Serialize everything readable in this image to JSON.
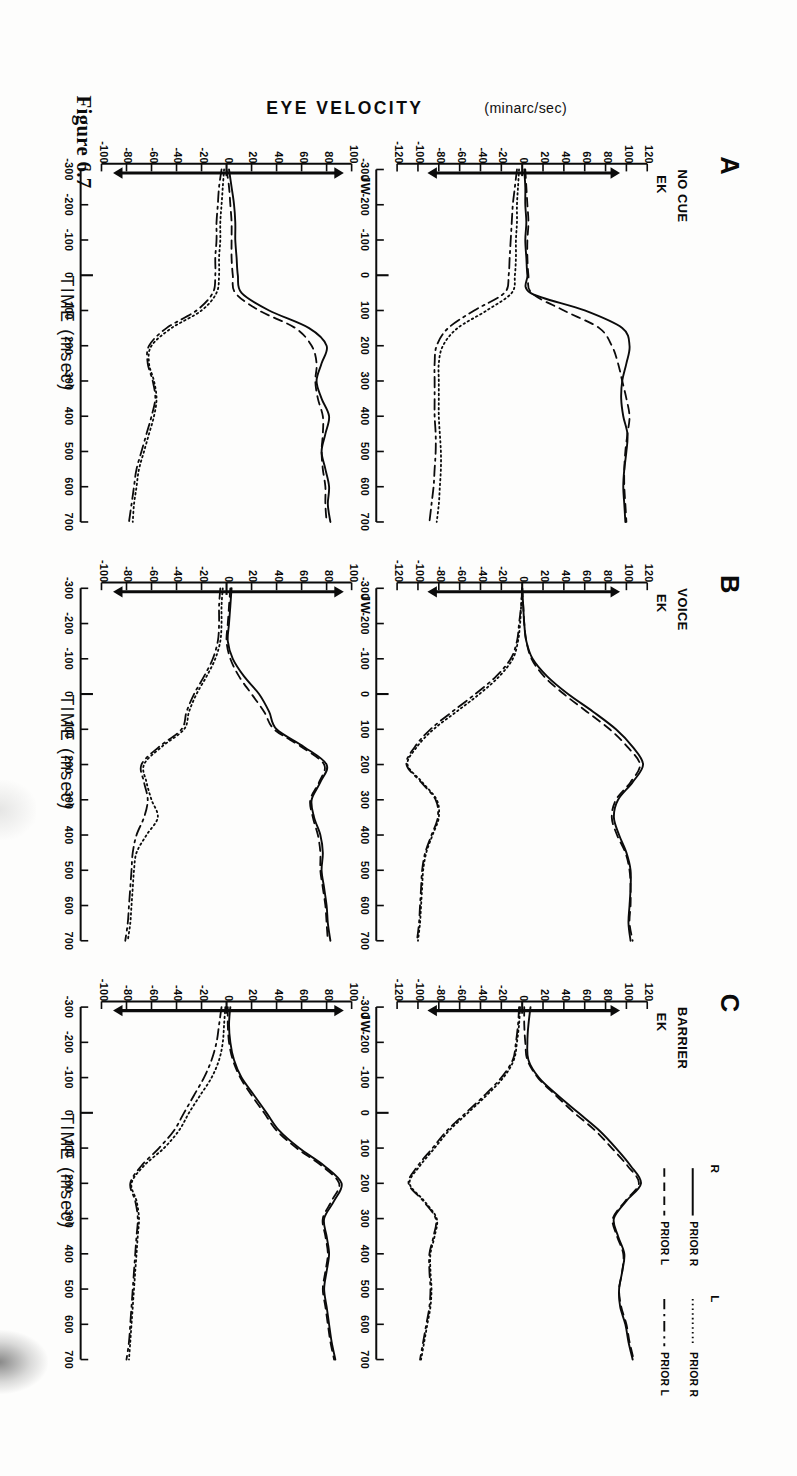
{
  "figure": {
    "caption": "Figure 6.7",
    "y_axis_label": "EYE VELOCITY",
    "y_axis_unit": "(minarc/sec)",
    "x_axis_label": "TIME (msec)"
  },
  "panels": [
    {
      "letter": "A",
      "condition": "NO CUE",
      "subjects": [
        {
          "name": "EK",
          "ylim": [
            -120,
            120
          ],
          "yticks": [
            120,
            100,
            80,
            60,
            40,
            20,
            0,
            -20,
            -40,
            -60,
            -80,
            -100,
            -120
          ]
        },
        {
          "name": "JW",
          "ylim": [
            -100,
            100
          ],
          "yticks": [
            100,
            80,
            60,
            40,
            20,
            0,
            -20,
            -40,
            -60,
            -80,
            -100
          ]
        }
      ]
    },
    {
      "letter": "B",
      "condition": "VOICE",
      "subjects": [
        {
          "name": "EK",
          "ylim": [
            -120,
            120
          ],
          "yticks": [
            120,
            100,
            80,
            60,
            40,
            20,
            0,
            -20,
            -40,
            -60,
            -80,
            -100,
            -120
          ]
        },
        {
          "name": "JW",
          "ylim": [
            -100,
            100
          ],
          "yticks": [
            100,
            80,
            60,
            40,
            20,
            0,
            -20,
            -40,
            -60,
            -80,
            -100
          ]
        }
      ]
    },
    {
      "letter": "C",
      "condition": "BARRIER",
      "subjects": [
        {
          "name": "EK",
          "ylim": [
            -120,
            120
          ],
          "yticks": [
            120,
            100,
            80,
            60,
            40,
            20,
            0,
            -20,
            -40,
            -60,
            -80,
            -100,
            -120
          ]
        },
        {
          "name": "JW",
          "ylim": [
            -100,
            100
          ],
          "yticks": [
            100,
            80,
            60,
            40,
            20,
            0,
            -20,
            -40,
            -60,
            -80,
            -100
          ]
        }
      ]
    }
  ],
  "xticks": [
    -300,
    -200,
    -100,
    0,
    100,
    200,
    300,
    400,
    500,
    600,
    700
  ],
  "legend": {
    "groups": [
      {
        "head": "R",
        "entries": [
          {
            "label": "PRIOR R",
            "style": "solid"
          },
          {
            "label": "PRIOR L",
            "style": "dashed"
          }
        ]
      },
      {
        "head": "L",
        "entries": [
          {
            "label": "PRIOR R",
            "style": "dotted"
          },
          {
            "label": "PRIOR L",
            "style": "dashdot"
          }
        ]
      }
    ]
  },
  "chart_data": {
    "type": "line",
    "title": "Figure 6.7",
    "xlabel": "TIME (msec)",
    "ylabel": "EYE VELOCITY (minarc/sec)",
    "xlim": [
      -300,
      700
    ],
    "grid": false,
    "legend_position": "top-right",
    "x": [
      -300,
      -250,
      -200,
      -150,
      -100,
      -50,
      0,
      50,
      100,
      150,
      200,
      250,
      300,
      350,
      400,
      450,
      500,
      550,
      600,
      650,
      700
    ],
    "arrow_markers": {
      "upper_y": 93,
      "lower_y": -90,
      "x": -290,
      "note": "vertical arrows at the left edge of each panel indicating target velocity"
    },
    "panels": [
      {
        "panel": "A",
        "condition": "NO CUE",
        "subject": "EK",
        "ylim": [
          -120,
          120
        ],
        "series": [
          {
            "name": "R PRIOR R",
            "style": "solid",
            "values": [
              2,
              3,
              3,
              4,
              3,
              4,
              5,
              8,
              60,
              96,
              103,
              100,
              96,
              95,
              97,
              101,
              100,
              98,
              97,
              98,
              99
            ]
          },
          {
            "name": "R PRIOR L",
            "style": "dashed",
            "values": [
              3,
              4,
              5,
              6,
              5,
              5,
              6,
              9,
              40,
              74,
              86,
              92,
              96,
              100,
              103,
              101,
              99,
              98,
              98,
              99,
              100
            ]
          },
          {
            "name": "L PRIOR R",
            "style": "dotted",
            "values": [
              -3,
              -4,
              -5,
              -5,
              -6,
              -6,
              -7,
              -10,
              -34,
              -62,
              -76,
              -80,
              -80,
              -80,
              -80,
              -79,
              -78,
              -78,
              -79,
              -80,
              -82
            ]
          },
          {
            "name": "L PRIOR L",
            "style": "dashdot",
            "values": [
              -5,
              -7,
              -9,
              -10,
              -11,
              -12,
              -13,
              -17,
              -46,
              -71,
              -82,
              -84,
              -84,
              -84,
              -84,
              -83,
              -83,
              -84,
              -85,
              -87,
              -89
            ]
          }
        ]
      },
      {
        "panel": "A",
        "condition": "NO CUE",
        "subject": "JW",
        "ylim": [
          -100,
          100
        ],
        "series": [
          {
            "name": "R PRIOR R",
            "style": "solid",
            "values": [
              2,
              4,
              6,
              7,
              7,
              8,
              9,
              12,
              34,
              66,
              80,
              76,
              72,
              76,
              82,
              79,
              76,
              79,
              82,
              81,
              83
            ]
          },
          {
            "name": "R PRIOR L",
            "style": "dashed",
            "values": [
              0,
              2,
              3,
              4,
              4,
              4,
              5,
              7,
              26,
              55,
              68,
              72,
              71,
              73,
              77,
              77,
              76,
              77,
              79,
              79,
              80
            ]
          },
          {
            "name": "L PRIOR R",
            "style": "dotted",
            "values": [
              -2,
              -3,
              -4,
              -5,
              -5,
              -6,
              -6,
              -8,
              -20,
              -44,
              -60,
              -62,
              -58,
              -56,
              -58,
              -62,
              -66,
              -70,
              -72,
              -74,
              -75
            ]
          },
          {
            "name": "L PRIOR L",
            "style": "dashdot",
            "values": [
              -4,
              -6,
              -7,
              -8,
              -8,
              -9,
              -9,
              -11,
              -24,
              -48,
              -62,
              -63,
              -59,
              -57,
              -60,
              -64,
              -68,
              -72,
              -74,
              -76,
              -78
            ]
          }
        ]
      },
      {
        "panel": "B",
        "condition": "VOICE",
        "subject": "EK",
        "ylim": [
          -120,
          120
        ],
        "series": [
          {
            "name": "R PRIOR R",
            "style": "solid",
            "values": [
              0,
              1,
              2,
              4,
              10,
              24,
              44,
              68,
              90,
              106,
              116,
              106,
              92,
              88,
              93,
              100,
              104,
              104,
              103,
              102,
              104
            ]
          },
          {
            "name": "R PRIOR L",
            "style": "dashed",
            "values": [
              0,
              1,
              2,
              4,
              9,
              21,
              40,
              62,
              84,
              101,
              113,
              104,
              90,
              86,
              91,
              99,
              103,
              104,
              104,
              103,
              106
            ]
          },
          {
            "name": "L PRIOR R",
            "style": "dotted",
            "values": [
              0,
              -1,
              -2,
              -4,
              -9,
              -22,
              -41,
              -63,
              -85,
              -101,
              -110,
              -96,
              -82,
              -80,
              -86,
              -92,
              -95,
              -96,
              -97,
              -98,
              -100
            ]
          },
          {
            "name": "L PRIOR L",
            "style": "dashdot",
            "values": [
              0,
              -1,
              -3,
              -5,
              -11,
              -25,
              -45,
              -67,
              -88,
              -103,
              -111,
              -97,
              -83,
              -81,
              -87,
              -93,
              -96,
              -97,
              -98,
              -99,
              -101
            ]
          }
        ]
      },
      {
        "panel": "B",
        "condition": "VOICE",
        "subject": "JW",
        "ylim": [
          -100,
          100
        ],
        "series": [
          {
            "name": "R PRIOR R",
            "style": "solid",
            "values": [
              4,
              3,
              2,
              1,
              5,
              14,
              26,
              34,
              40,
              62,
              80,
              75,
              68,
              70,
              75,
              77,
              76,
              78,
              80,
              81,
              83
            ]
          },
          {
            "name": "R PRIOR L",
            "style": "dashed",
            "values": [
              3,
              2,
              1,
              0,
              3,
              10,
              20,
              30,
              38,
              60,
              78,
              74,
              67,
              69,
              73,
              75,
              75,
              77,
              79,
              80,
              81
            ]
          },
          {
            "name": "L PRIOR R",
            "style": "dotted",
            "values": [
              -3,
              -4,
              -4,
              -5,
              -9,
              -16,
              -24,
              -30,
              -34,
              -52,
              -66,
              -64,
              -60,
              -55,
              -64,
              -72,
              -74,
              -75,
              -76,
              -77,
              -79
            ]
          },
          {
            "name": "L PRIOR L",
            "style": "dashdot",
            "values": [
              -5,
              -6,
              -6,
              -7,
              -11,
              -18,
              -26,
              -32,
              -36,
              -54,
              -68,
              -66,
              -63,
              -66,
              -72,
              -75,
              -76,
              -77,
              -78,
              -79,
              -81
            ]
          }
        ]
      },
      {
        "panel": "C",
        "condition": "BARRIER",
        "subject": "EK",
        "ylim": [
          -120,
          120
        ],
        "series": [
          {
            "name": "R PRIOR R",
            "style": "solid",
            "values": [
              8,
              6,
              5,
              6,
              16,
              34,
              54,
              74,
              90,
              104,
              114,
              100,
              88,
              92,
              98,
              96,
              93,
              94,
              99,
              102,
              106
            ]
          },
          {
            "name": "R PRIOR L",
            "style": "dashed",
            "values": [
              2,
              2,
              3,
              5,
              15,
              32,
              50,
              70,
              86,
              101,
              112,
              99,
              87,
              91,
              97,
              96,
              93,
              95,
              100,
              103,
              107
            ]
          },
          {
            "name": "L PRIOR R",
            "style": "dotted",
            "values": [
              -2,
              -3,
              -5,
              -8,
              -18,
              -34,
              -52,
              -70,
              -84,
              -98,
              -108,
              -94,
              -82,
              -84,
              -88,
              -88,
              -87,
              -88,
              -91,
              -94,
              -97
            ]
          },
          {
            "name": "L PRIOR L",
            "style": "dashdot",
            "values": [
              -3,
              -4,
              -6,
              -9,
              -20,
              -36,
              -54,
              -72,
              -86,
              -100,
              -109,
              -95,
              -83,
              -85,
              -89,
              -89,
              -88,
              -89,
              -92,
              -95,
              -98
            ]
          }
        ]
      },
      {
        "panel": "C",
        "condition": "BARRIER",
        "subject": "JW",
        "ylim": [
          -100,
          100
        ],
        "series": [
          {
            "name": "R PRIOR R",
            "style": "solid",
            "values": [
              3,
              2,
              3,
              6,
              12,
              22,
              32,
              42,
              58,
              78,
              92,
              86,
              78,
              80,
              82,
              80,
              78,
              80,
              82,
              84,
              87
            ]
          },
          {
            "name": "R PRIOR L",
            "style": "dashed",
            "values": [
              1,
              1,
              2,
              5,
              11,
              20,
              30,
              40,
              56,
              76,
              90,
              84,
              77,
              79,
              81,
              79,
              77,
              79,
              81,
              83,
              86
            ]
          },
          {
            "name": "L PRIOR R",
            "style": "dotted",
            "values": [
              -1,
              -2,
              -3,
              -6,
              -12,
              -21,
              -30,
              -38,
              -50,
              -66,
              -76,
              -72,
              -70,
              -71,
              -72,
              -73,
              -74,
              -75,
              -76,
              -77,
              -78
            ]
          },
          {
            "name": "L PRIOR L",
            "style": "dashdot",
            "values": [
              -4,
              -6,
              -8,
              -12,
              -18,
              -26,
              -34,
              -42,
              -54,
              -68,
              -77,
              -73,
              -71,
              -72,
              -73,
              -74,
              -75,
              -76,
              -77,
              -78,
              -80
            ]
          }
        ]
      }
    ]
  }
}
